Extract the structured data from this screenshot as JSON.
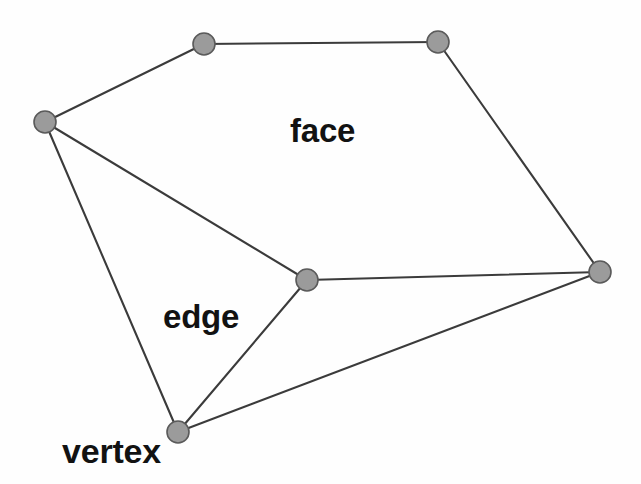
{
  "diagram": {
    "background_color": "#fefefe",
    "edge_color": "#3b3b3b",
    "vertex_fill_color": "#9b9b9b",
    "vertex_stroke_color": "#5a5a5a",
    "label_color": "#121212",
    "vertex_radius": 11,
    "labels": {
      "face": "face",
      "edge": "edge",
      "vertex": "vertex"
    },
    "vertices": [
      {
        "id": "top-left",
        "x": 204,
        "y": 44
      },
      {
        "id": "top-right",
        "x": 438,
        "y": 42
      },
      {
        "id": "left",
        "x": 45,
        "y": 122
      },
      {
        "id": "center",
        "x": 307,
        "y": 280
      },
      {
        "id": "right",
        "x": 600,
        "y": 272
      },
      {
        "id": "bottom",
        "x": 178,
        "y": 432
      }
    ],
    "edges": [
      {
        "from": "top-left",
        "to": "top-right"
      },
      {
        "from": "left",
        "to": "top-left"
      },
      {
        "from": "top-right",
        "to": "right"
      },
      {
        "from": "left",
        "to": "center"
      },
      {
        "from": "left",
        "to": "bottom"
      },
      {
        "from": "center",
        "to": "right"
      },
      {
        "from": "center",
        "to": "bottom"
      },
      {
        "from": "bottom",
        "to": "right"
      }
    ]
  }
}
